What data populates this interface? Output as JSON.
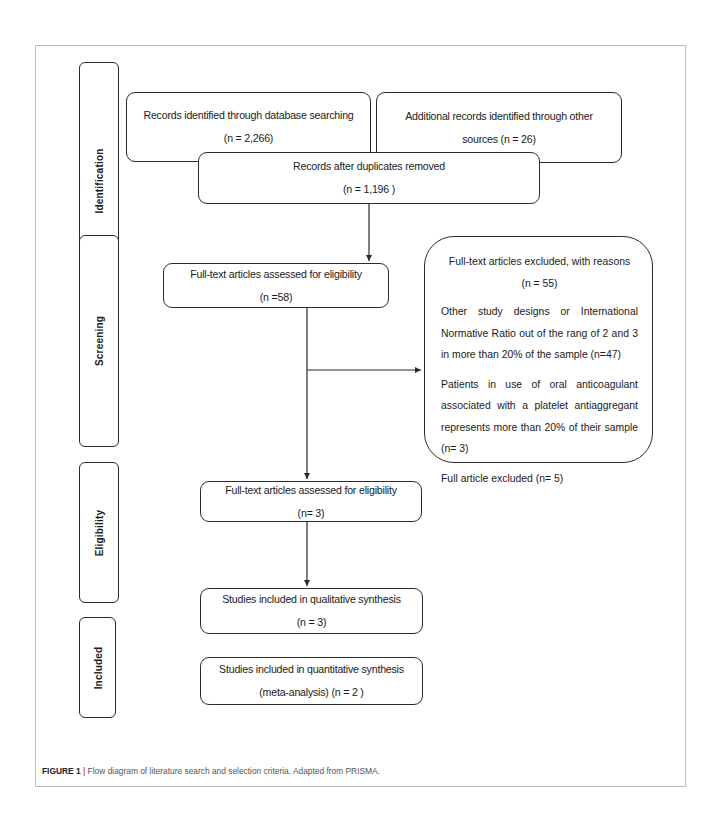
{
  "stages": [
    {
      "label": "Identification"
    },
    {
      "label": "Screening"
    },
    {
      "label": "Eligibility"
    },
    {
      "label": "Included"
    }
  ],
  "boxes": {
    "database_search": {
      "line1": "Records identified through database searching",
      "line2": "(n =  2,266)"
    },
    "other_sources": {
      "line1": "Additional records identified through other",
      "line2": "sources (n =  26)"
    },
    "duplicates_removed": {
      "line1": "Records after duplicates removed",
      "line2": "(n = 1,196 )"
    },
    "fulltext_screening": {
      "line1": "Full-text articles assessed for eligibility",
      "line2": "(n =58)"
    },
    "fulltext_eligibility": {
      "line1": "Full-text articles assessed for eligibility",
      "line2": "(n= 3)"
    },
    "qualitative": {
      "line1": "Studies included in qualitative synthesis",
      "line2": "(n = 3)"
    },
    "quantitative": {
      "line1": "Studies included in quantitative synthesis",
      "line2": "(meta-analysis) (n = 2 )"
    }
  },
  "excluded": {
    "title": "Full-text articles excluded, with reasons",
    "count": "(n = 55)",
    "reasons": [
      "Other study designs or International Normative Ratio out of the rang of 2 and 3 in more than 20% of the sample (n=47)",
      "Patients in use of oral anticoagulant associated with a platelet antiaggregant represents more than 20% of their sample (n= 3)",
      "Full article excluded (n= 5)"
    ]
  },
  "caption": {
    "label": "FIGURE 1",
    "separator": "|",
    "text": " Flow diagram of literature search and selection criteria. Adapted from PRISMA."
  },
  "colors": {
    "stroke": "#2b2b2b",
    "frame": "#bdbdbd",
    "caption_bar": "#d2691e"
  }
}
